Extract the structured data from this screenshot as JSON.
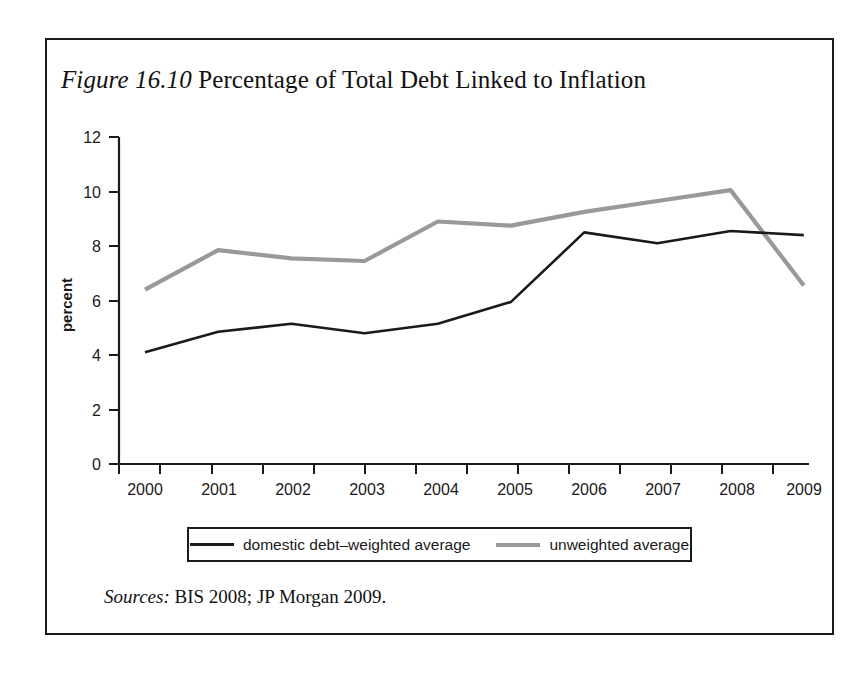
{
  "figure": {
    "label": "Figure 16.10",
    "title_rest": " Percentage of Total Debt Linked to Inflation",
    "full_title": "Figure 16.10 Percentage of Total Debt Linked to Inflation"
  },
  "sources": {
    "label": "Sources:",
    "text": " BIS 2008; JP Morgan 2009.",
    "full": "Sources: BIS 2008; JP Morgan 2009."
  },
  "legend": {
    "position": "below-plot",
    "entries": [
      {
        "name": "domestic debt–weighted average",
        "color": "#1a1a1a"
      },
      {
        "name": "unweighted average",
        "color": "#999999"
      }
    ]
  },
  "colors": {
    "domestic_line": "#1a1a1a",
    "unweighted_line": "#999999",
    "axis": "#1a1a1a",
    "frame": "#1a1a1a",
    "background": "#ffffff"
  },
  "chart_data": {
    "type": "line",
    "title": "Figure 16.10 Percentage of Total Debt Linked to Inflation",
    "xlabel": "",
    "ylabel": "percent",
    "x": [
      "2000",
      "2001",
      "2002",
      "2003",
      "2004",
      "2005",
      "2006",
      "2007",
      "2008",
      "2009"
    ],
    "categories": [
      "2000",
      "2001",
      "2002",
      "2003",
      "2004",
      "2005",
      "2006",
      "2007",
      "2008",
      "2009"
    ],
    "xtick_labels": [
      "2000",
      "2001",
      "2002",
      "2003",
      "2004",
      "2005",
      "2006",
      "2007",
      "2008",
      "2009"
    ],
    "ytick_labels": [
      "0",
      "2",
      "4",
      "6",
      "8",
      "10",
      "12"
    ],
    "yticks": [
      0,
      2,
      4,
      6,
      8,
      10,
      12
    ],
    "ylim": [
      0,
      12
    ],
    "grid": false,
    "series": [
      {
        "name": "domestic debt–weighted average",
        "color": "#1a1a1a",
        "values": [
          4.1,
          4.85,
          5.15,
          4.8,
          5.15,
          5.95,
          8.5,
          8.1,
          8.55,
          8.4
        ]
      },
      {
        "name": "unweighted average",
        "color": "#999999",
        "values": [
          6.4,
          7.85,
          7.55,
          7.45,
          8.9,
          8.75,
          9.25,
          9.65,
          10.05,
          6.55
        ]
      }
    ]
  }
}
